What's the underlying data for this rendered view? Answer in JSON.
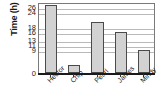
{
  "chart_data": {
    "type": "bar",
    "title": "",
    "xlabel": "",
    "ylabel": "Time (h)",
    "categories": [
      "Hector",
      "Chip",
      "Pearl",
      "James",
      "Mindy"
    ],
    "values": [
      27,
      3,
      20,
      16,
      9
    ],
    "ytick_labels": [
      "0",
      "9",
      "11",
      "13",
      "16",
      "18",
      "24",
      "26"
    ],
    "ytick_values": [
      0,
      9,
      11,
      13,
      16,
      18,
      24,
      26
    ],
    "ylim": [
      0,
      28
    ],
    "grid": true,
    "legend": "none",
    "bar_fill": "#d2d2d2",
    "bar_edge": "#4a4a4a",
    "grid_color": "#b9b9b9",
    "axis_color": "#1a1a1a"
  }
}
